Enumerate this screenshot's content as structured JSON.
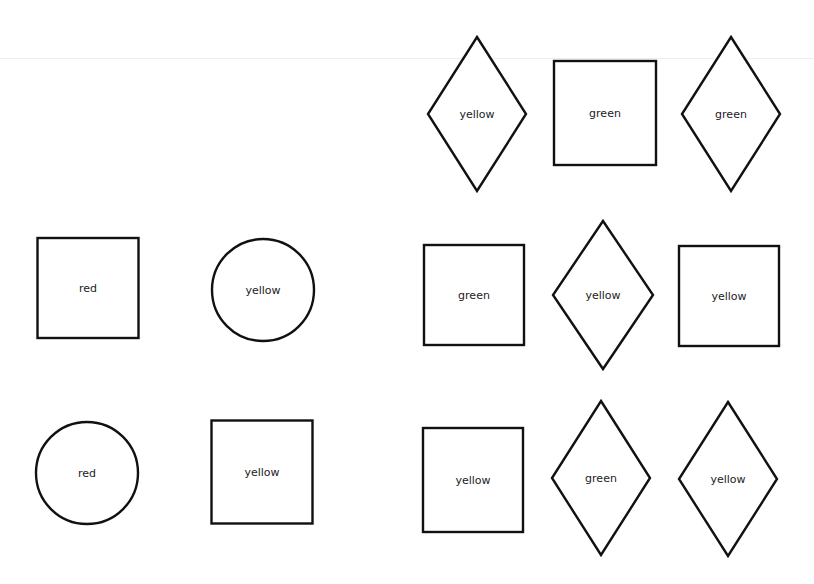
{
  "diagram": {
    "shapes": [
      {
        "type": "diamond",
        "label": "yellow",
        "cx": 477,
        "cy": 114,
        "w": 98,
        "h": 154
      },
      {
        "type": "square",
        "label": "green",
        "cx": 605,
        "cy": 113,
        "w": 102,
        "h": 104
      },
      {
        "type": "diamond",
        "label": "green",
        "cx": 731,
        "cy": 114,
        "w": 98,
        "h": 154
      },
      {
        "type": "square",
        "label": "red",
        "cx": 88,
        "cy": 288,
        "w": 101,
        "h": 100
      },
      {
        "type": "circle",
        "label": "yellow",
        "cx": 263,
        "cy": 290,
        "r": 51
      },
      {
        "type": "square",
        "label": "green",
        "cx": 474,
        "cy": 295,
        "w": 100,
        "h": 100
      },
      {
        "type": "diamond",
        "label": "yellow",
        "cx": 603,
        "cy": 295,
        "w": 100,
        "h": 148
      },
      {
        "type": "square",
        "label": "yellow",
        "cx": 729,
        "cy": 296,
        "w": 100,
        "h": 100
      },
      {
        "type": "circle",
        "label": "red",
        "cx": 87,
        "cy": 473,
        "r": 51
      },
      {
        "type": "square",
        "label": "yellow",
        "cx": 262,
        "cy": 472,
        "w": 101,
        "h": 103
      },
      {
        "type": "square",
        "label": "yellow",
        "cx": 473,
        "cy": 480,
        "w": 100,
        "h": 104
      },
      {
        "type": "diamond",
        "label": "green",
        "cx": 601,
        "cy": 478,
        "w": 98,
        "h": 154
      },
      {
        "type": "diamond",
        "label": "yellow",
        "cx": 728,
        "cy": 479,
        "w": 98,
        "h": 154
      }
    ]
  }
}
